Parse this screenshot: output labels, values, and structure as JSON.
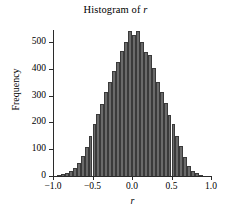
{
  "chart_data": {
    "type": "bar",
    "title": "Histogram of r",
    "title_plain": "Histogram of ",
    "title_italic_var": "r",
    "xlabel": "r",
    "ylabel": "Frequency",
    "xlim": [
      -1.0,
      1.0
    ],
    "ylim": [
      0,
      560
    ],
    "xticks": [
      -1.0,
      -0.5,
      0.0,
      0.5,
      1.0
    ],
    "xtick_labels": [
      "-1.0",
      "-0.5",
      "0.0",
      "0.5",
      "1.0"
    ],
    "yticks": [
      0,
      100,
      200,
      300,
      400,
      500
    ],
    "ytick_labels": [
      "0",
      "100",
      "200",
      "300",
      "400",
      "500"
    ],
    "grid": false,
    "legend": null,
    "bar_color": "#6a6a6a",
    "bar_edge_color": "#3a3a3a",
    "axis_color": "#2b2b2b",
    "background": "#ffffff",
    "bin_width": 0.05,
    "bin_left_edges": [
      -0.95,
      -0.9,
      -0.85,
      -0.8,
      -0.75,
      -0.7,
      -0.65,
      -0.6,
      -0.55,
      -0.5,
      -0.45,
      -0.4,
      -0.35,
      -0.3,
      -0.25,
      -0.2,
      -0.15,
      -0.1,
      -0.05,
      0.0,
      0.05,
      0.1,
      0.15,
      0.2,
      0.25,
      0.3,
      0.35,
      0.4,
      0.45,
      0.5,
      0.55,
      0.6,
      0.65,
      0.7,
      0.75,
      0.8,
      0.85
    ],
    "bin_centers": [
      -0.925,
      -0.875,
      -0.825,
      -0.775,
      -0.725,
      -0.675,
      -0.625,
      -0.575,
      -0.525,
      -0.475,
      -0.425,
      -0.375,
      -0.325,
      -0.275,
      -0.225,
      -0.175,
      -0.125,
      -0.075,
      -0.025,
      0.025,
      0.075,
      0.125,
      0.175,
      0.225,
      0.275,
      0.325,
      0.375,
      0.425,
      0.475,
      0.525,
      0.575,
      0.625,
      0.675,
      0.725,
      0.775,
      0.825,
      0.875
    ],
    "categories": [
      "-0.925",
      "-0.875",
      "-0.825",
      "-0.775",
      "-0.725",
      "-0.675",
      "-0.625",
      "-0.575",
      "-0.525",
      "-0.475",
      "-0.425",
      "-0.375",
      "-0.325",
      "-0.275",
      "-0.225",
      "-0.175",
      "-0.125",
      "-0.075",
      "-0.025",
      "0.025",
      "0.075",
      "0.125",
      "0.175",
      "0.225",
      "0.275",
      "0.325",
      "0.375",
      "0.425",
      "0.475",
      "0.525",
      "0.575",
      "0.625",
      "0.675",
      "0.725",
      "0.775",
      "0.825",
      "0.875"
    ],
    "values": [
      3,
      6,
      10,
      18,
      30,
      48,
      75,
      108,
      150,
      196,
      232,
      268,
      312,
      352,
      392,
      425,
      468,
      500,
      540,
      525,
      542,
      500,
      462,
      452,
      405,
      352,
      312,
      272,
      228,
      196,
      150,
      112,
      72,
      38,
      20,
      10,
      4
    ]
  }
}
